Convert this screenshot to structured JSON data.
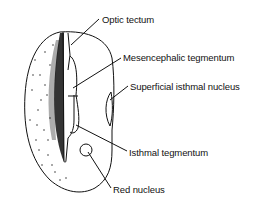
{
  "diagram": {
    "type": "anatomical-section",
    "colors": {
      "ink": "#111111",
      "background": "#ffffff"
    },
    "labels": [
      {
        "id": "optic-tectum",
        "text": "Optic tectum",
        "x": 102,
        "y": 14
      },
      {
        "id": "mesencephalic-tegmentum",
        "text": "Mesencephalic tegmentum",
        "x": 123,
        "y": 52
      },
      {
        "id": "superficial-isthmal-nucleus",
        "text": "Superficial isthmal nucleus",
        "x": 130,
        "y": 81
      },
      {
        "id": "isthmal-tegmentum",
        "text": "Isthmal tegmentum",
        "x": 129,
        "y": 147
      },
      {
        "id": "red-nucleus",
        "text": "Red nucleus",
        "x": 113,
        "y": 184
      }
    ]
  }
}
